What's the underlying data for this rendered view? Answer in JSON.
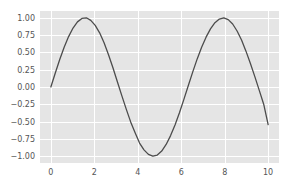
{
  "chart_data": {
    "type": "line",
    "title": "",
    "subtitle": "",
    "xlabel": "",
    "ylabel": "",
    "style": "seaborn-darkgrid",
    "grid": true,
    "legend": null,
    "xlim": [
      -0.5,
      10.5
    ],
    "ylim": [
      -1.098,
      1.098
    ],
    "xticks": [
      0,
      2,
      4,
      6,
      8,
      10
    ],
    "xtick_labels": [
      "0",
      "2",
      "4",
      "6",
      "8",
      "10"
    ],
    "yticks": [
      -1.0,
      -0.75,
      -0.5,
      -0.25,
      0.0,
      0.25,
      0.5,
      0.75,
      1.0
    ],
    "ytick_labels": [
      "−1.00",
      "−0.75",
      "−0.50",
      "−0.25",
      "0.00",
      "0.25",
      "0.50",
      "0.75",
      "1.00"
    ],
    "series": [
      {
        "name": "sin(x)",
        "color": "#4c4c4c",
        "linewidth": 1.3,
        "x": [
          0.0,
          0.204,
          0.408,
          0.612,
          0.816,
          1.02,
          1.224,
          1.429,
          1.633,
          1.837,
          2.041,
          2.245,
          2.449,
          2.653,
          2.857,
          3.061,
          3.265,
          3.469,
          3.673,
          3.878,
          4.082,
          4.286,
          4.49,
          4.694,
          4.898,
          5.102,
          5.306,
          5.51,
          5.714,
          5.918,
          6.122,
          6.327,
          6.531,
          6.735,
          6.939,
          7.143,
          7.347,
          7.551,
          7.755,
          7.959,
          8.163,
          8.367,
          8.571,
          8.776,
          8.98,
          9.184,
          9.388,
          9.592,
          9.796,
          10.0
        ],
        "y": [
          0.0,
          0.203,
          0.397,
          0.574,
          0.728,
          0.852,
          0.941,
          0.991,
          1.0,
          0.963,
          0.89,
          0.783,
          0.638,
          0.467,
          0.279,
          0.075,
          -0.125,
          -0.319,
          -0.504,
          -0.662,
          -0.81,
          -0.908,
          -0.974,
          -1.0,
          -0.983,
          -0.925,
          -0.83,
          -0.702,
          -0.548,
          -0.372,
          -0.179,
          0.021,
          0.219,
          0.406,
          0.574,
          0.72,
          0.84,
          0.93,
          0.982,
          0.999,
          0.973,
          0.91,
          0.809,
          0.678,
          0.518,
          0.339,
          0.15,
          -0.049,
          -0.249,
          -0.544
        ]
      }
    ]
  },
  "figure": {
    "background_color": "#ffffff",
    "axes_background_color": "#e5e5e5",
    "grid_color": "#ffffff",
    "tick_label_color": "#555555"
  }
}
